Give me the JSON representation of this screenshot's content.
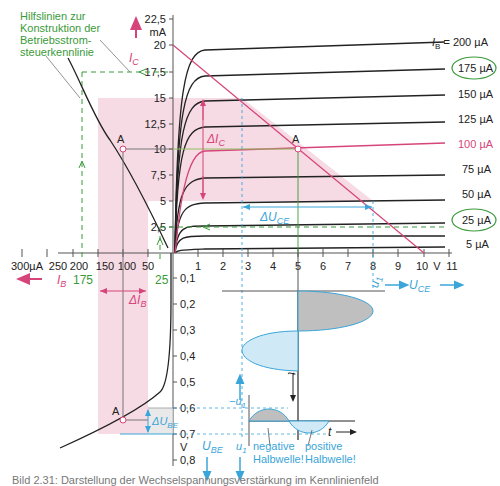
{
  "annotation": {
    "helper_lines_text": [
      "Hilfslinien zur",
      "Konstruktion der",
      "Betriebsstrom-",
      "steuerkennlinie"
    ]
  },
  "axes": {
    "ic_axis": {
      "label": "I",
      "sub": "C",
      "unit": "mA",
      "ticks": [
        "2,5",
        "5",
        "7,5",
        "10",
        "12,5",
        "15",
        "17,5",
        "20",
        "22,5"
      ]
    },
    "uce_axis": {
      "label": "U",
      "sub": "CE",
      "unit": "V",
      "ticks": [
        "1",
        "2",
        "3",
        "4",
        "5",
        "6",
        "7",
        "8",
        "9",
        "10",
        "11"
      ]
    },
    "ib_axis": {
      "label": "I",
      "sub": "B",
      "unit": "µA",
      "ticks": [
        "300µA",
        "250",
        "200",
        "150",
        "100",
        "50"
      ]
    },
    "ube_axis": {
      "label": "U",
      "sub": "BE",
      "unit": "V",
      "ticks": [
        "0,1",
        "0,2",
        "0,3",
        "0,4",
        "0,5",
        "0,6",
        "0,7",
        "0,8"
      ]
    }
  },
  "curves": {
    "ib_labels": [
      {
        "text": "= 200 µA",
        "prefix": "I",
        "sub": "B",
        "circled": false,
        "color": "#222222"
      },
      {
        "text": "175 µA",
        "circled": true,
        "color": "#222222"
      },
      {
        "text": "150 µA",
        "circled": false,
        "color": "#222222"
      },
      {
        "text": "125 µA",
        "circled": false,
        "color": "#222222"
      },
      {
        "text": "100 µA",
        "circled": false,
        "color": "#d6457a"
      },
      {
        "text": "75 µA",
        "circled": false,
        "color": "#222222"
      },
      {
        "text": "50 µA",
        "circled": false,
        "color": "#222222"
      },
      {
        "text": "25 µA",
        "circled": true,
        "color": "#222222"
      },
      {
        "text": "5 µA",
        "circled": false,
        "color": "#222222"
      }
    ]
  },
  "markers": {
    "operating_point": "A",
    "delta_ic": "ΔI",
    "delta_ic_sub": "C",
    "delta_uce": "ΔU",
    "delta_uce_sub": "CE",
    "delta_ib": "ΔI",
    "delta_ib_sub": "B",
    "delta_ube": "ΔU",
    "delta_ube_sub": "BE",
    "green_175": "175",
    "green_25": "25",
    "u1": "u",
    "u1_sub": "1",
    "minus_u1": "−u",
    "t": "t",
    "negative_halfwave": [
      "negative",
      "Halbwelle!"
    ],
    "positive_halfwave": [
      "positive",
      "Halbwelle!"
    ]
  },
  "colors": {
    "pink": "#d6457a",
    "pink_fill": "#f5d3df",
    "green": "#3a9a3a",
    "blue": "#3aa5d8",
    "blue_fill": "#cfe9f6",
    "gray_fill": "#bfbfbf",
    "black": "#222222"
  },
  "caption": "Bild 2.31: Darstellung der Wechselspannungsverstärkung im Kennlinienfeld"
}
